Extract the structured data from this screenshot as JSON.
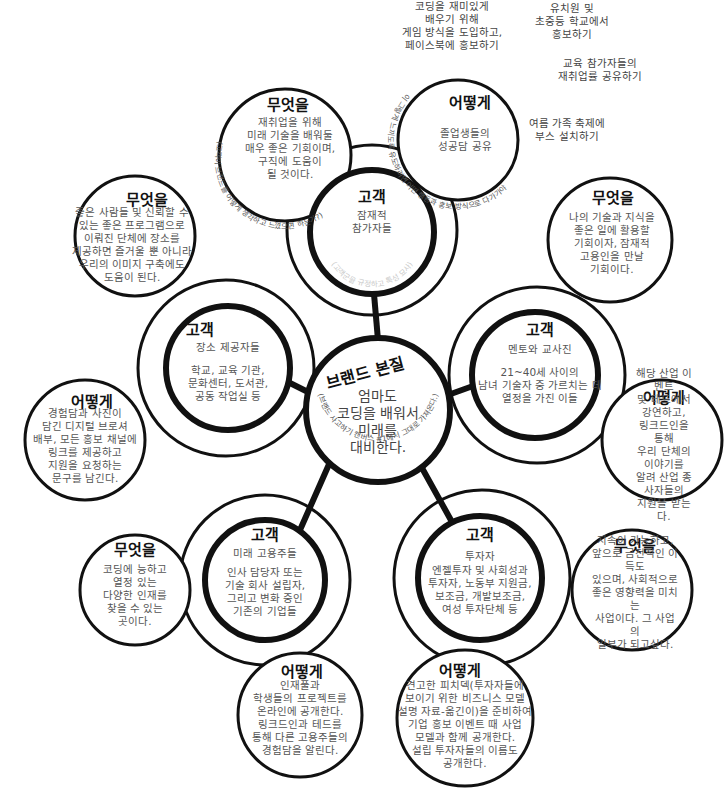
{
  "diagram": {
    "core": {
      "heading": "브랜드 본질",
      "statement": "엄마도\n코딩을 배워서\n미래를\n대비한다.",
      "arc_note": "(브랜드 사고하기 캔버스 #1에서 그대로 가져온다.)"
    },
    "labels": {
      "customer": "고객",
      "what": "무엇을",
      "how": "어떻게"
    },
    "segments": [
      {
        "id": "potential-participants",
        "customer": "잠재적\n참가자들",
        "customer_note": "(고객군을 규정하고 특성 묘사)",
        "what": "재취업을 위해\n미래 기술을 배워둘\n매우 좋은 기회이며,\n구직에 도움이\n될 것이다.",
        "what_arc_note": "(고객이 브랜드를 어떻게 생각하고 느꼈으면 하는가?)",
        "how": "졸업생들의\n성공담 공유",
        "how_arc_note": "(고객들이 그렇게 느끼도록 유도하려면 어떤 행동과 홍보 방식으로 다가가야 하는가?)"
      },
      {
        "id": "mentors-teachers",
        "customer": "멘토와 교사진",
        "customer_detail": "21~40세 사이의\n남녀 기술자 중 가르치는 데\n열정을 가진 이들",
        "what": "나의 기술과 지식을\n좋은 일에 활용할\n기회이자, 잠재적\n고용인을 만날\n기회이다.",
        "how": "해당 산업 이벤트\n및 테드에서 강연하고,\n링크드인을 통해\n우리 단체의 이야기를\n알려 산업 종사자들의\n지원을 받는다."
      },
      {
        "id": "investors",
        "customer": "투자자",
        "customer_detail": "엔젤투자 및 사회성과\n투자자, 노동부 지원금,\n보조금, 개발보조금,\n여성 투자단체 등",
        "what": "지속이 가능하고,\n앞으로 금전적인 이득도\n있으며, 사회적으로\n좋은 영향력을 미치는\n사업이다. 그 사업의\n일부가 되고싶다.",
        "how": "견고한 피치덱(투자자들에\n보이기 위한 비즈니스 모델\n설명 자료-옮긴이)을 준비하여\n기업 홍보 이벤트 때 사업\n모델과 함께 공개한다.\n설립 투자자들의 이름도\n공개한다."
      },
      {
        "id": "future-employers",
        "customer": "미래 고용주들",
        "customer_detail": "인사 담당자 또는\n기술 회사 설립자,\n그리고 변화 중인\n기존의 기업들",
        "what": "코딩에 능하고\n열정 있는\n다양한 인재를\n찾을 수 있는\n곳이다.",
        "how": "인재풀과\n학생들의 프로젝트를\n온라인에 공개한다.\n링크드인과 테드를\n통해 다른 고용주들의\n경험담을 알린다."
      },
      {
        "id": "venue-providers",
        "customer": "장소 제공자들",
        "customer_detail": "학교, 교육 기관,\n문화센터, 도서관,\n공동 작업실 등",
        "what": "좋은 사람들 및 신뢰할 수\n있는 좋은 프로그램으로\n이뤄진 단체에 장소를\n제공하면 즐거울 뿐 아니라\n우리의 이미지 구축에도\n도움이 된다.",
        "how": "경험담과 사진이\n담긴 디지털 브로셔\n배부, 모든 홍보 채널에\n링크를 제공하고\n지원을 요청하는\n문구를 남긴다."
      }
    ],
    "floating_notes": [
      "코딩을 재미있게\n배우기 위해\n게임 방식을 도입하고,\n페이스북에 홍보하기",
      "유치원 및\n초중등 학교에서\n홍보하기",
      "교육 참가자들의\n재취업률 공유하기",
      "여름 가족 축제에\n부스 설치하기"
    ]
  }
}
